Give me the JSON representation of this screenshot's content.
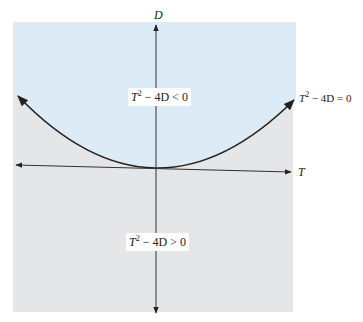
{
  "diagram": {
    "type": "trace-determinant plane",
    "axes": {
      "horizontal_label": "T",
      "vertical_label": "D"
    },
    "curve": {
      "equation": "T^2 - 4D = 0",
      "label_var": "T",
      "label_exp": "2",
      "label_rest": " − 4D = 0"
    },
    "regions": [
      {
        "name": "above-parabola",
        "label_var": "T",
        "label_exp": "2",
        "label_rest": " − 4D < 0",
        "fill": "#dcebf5"
      },
      {
        "name": "below-parabola",
        "label_var": "T",
        "label_exp": "2",
        "label_rest": " − 4D > 0",
        "fill": "#e5e6e8"
      }
    ],
    "colors": {
      "upper_region": "#dcebf5",
      "lower_region": "#e5e6e8",
      "line": "#222222"
    }
  }
}
